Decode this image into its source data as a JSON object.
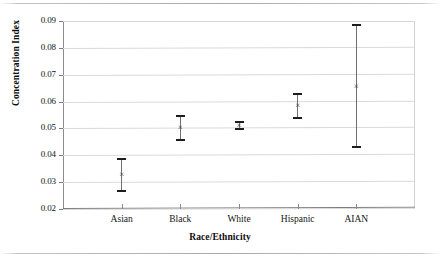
{
  "figure": {
    "name": "concentration-index-by-race-ethnicity",
    "background": "#ffffff",
    "ink_color": "#1a1a1a",
    "grid_color": "#d9d9d9",
    "axis_color": "#7d7d7d",
    "marker_color": "#3a3a3a",
    "cap_color": "#1d1d1d"
  },
  "chart_data": {
    "type": "scatter",
    "title": "",
    "subtitle": "",
    "xlabel": "Race/Ethnicity",
    "ylabel": "Concentration Index",
    "categories": [
      "Asian",
      "Black",
      "White",
      "Hispanic",
      "AIAN"
    ],
    "values": [
      0.0328,
      0.0503,
      0.051,
      0.0585,
      0.0656
    ],
    "error_low": [
      0.0268,
      0.0458,
      0.0498,
      0.054,
      0.043
    ],
    "error_high": [
      0.0386,
      0.0545,
      0.0523,
      0.063,
      0.0885
    ],
    "series": [
      {
        "name": "Concentration Index",
        "marker": "x",
        "points": [
          {
            "category": "Asian",
            "value": 0.0328,
            "lower": 0.0268,
            "upper": 0.0386
          },
          {
            "category": "Black",
            "value": 0.0503,
            "lower": 0.0458,
            "upper": 0.0545
          },
          {
            "category": "White",
            "value": 0.051,
            "lower": 0.0498,
            "upper": 0.0523
          },
          {
            "category": "Hispanic",
            "value": 0.0585,
            "lower": 0.054,
            "upper": 0.063
          },
          {
            "category": "AIAN",
            "value": 0.0656,
            "lower": 0.043,
            "upper": 0.0885
          }
        ]
      }
    ],
    "ylim": [
      0.02,
      0.09
    ],
    "ytick_labels": [
      "0.09",
      "0.08",
      "0.07",
      "0.06",
      "0.05",
      "0.04",
      "0.03",
      "0.02"
    ],
    "ytick_values": [
      0.09,
      0.08,
      0.07,
      0.06,
      0.05,
      0.04,
      0.03,
      0.02
    ],
    "xlim": [
      0,
      6
    ],
    "grid": "horizontal",
    "legend": "none",
    "errorbar_style": "capped-vertical"
  }
}
